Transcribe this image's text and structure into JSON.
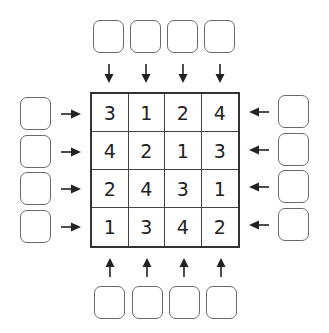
{
  "puzzle": {
    "grid": [
      [
        "3",
        "1",
        "2",
        "4"
      ],
      [
        "4",
        "2",
        "1",
        "3"
      ],
      [
        "2",
        "4",
        "3",
        "1"
      ],
      [
        "1",
        "3",
        "4",
        "2"
      ]
    ],
    "clues": {
      "top": [
        "",
        "",
        "",
        ""
      ],
      "bottom": [
        "",
        "",
        "",
        ""
      ],
      "left": [
        "",
        "",
        "",
        ""
      ],
      "right": [
        "",
        "",
        "",
        ""
      ]
    }
  },
  "icons": {
    "top_arrows": "arrow-down-icon",
    "bottom_arrows": "arrow-up-icon",
    "left_arrows": "arrow-right-icon",
    "right_arrows": "arrow-left-icon"
  },
  "colors": {
    "line": "#333333",
    "box_border": "#6a6a6a",
    "text": "#222222"
  }
}
